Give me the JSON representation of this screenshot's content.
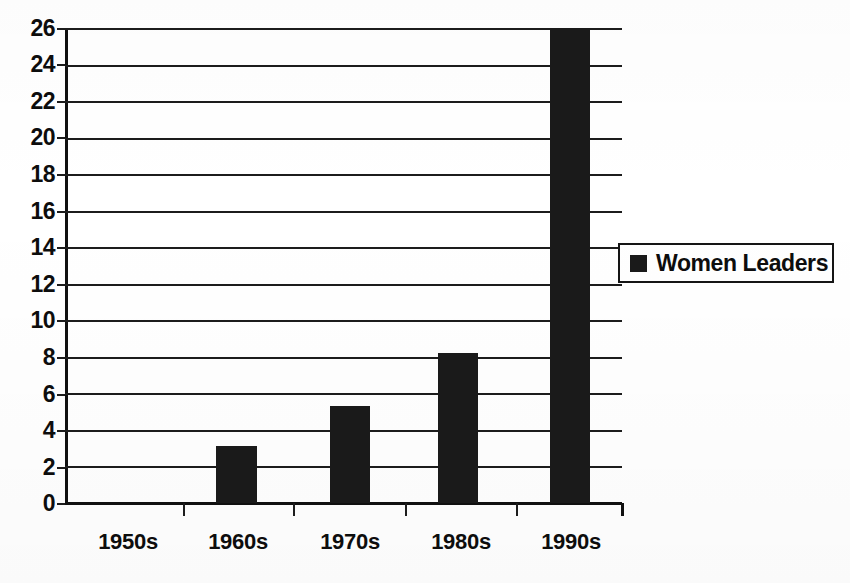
{
  "chart_data": {
    "type": "bar",
    "title": "",
    "subtitle": "",
    "xlabel": "",
    "ylabel": "",
    "categories": [
      "1950s",
      "1960s",
      "1970s",
      "1980s",
      "1990s"
    ],
    "series": [
      {
        "name": "Women Leaders",
        "values": [
          0,
          3.1,
          5.3,
          8.2,
          26
        ]
      }
    ],
    "values": [
      0,
      3.1,
      5.3,
      8.2,
      26
    ],
    "ylim": [
      0,
      26
    ],
    "yticks": [
      0,
      2,
      4,
      6,
      8,
      10,
      12,
      14,
      16,
      18,
      20,
      22,
      24,
      26
    ],
    "ytick_labels": [
      "0",
      "2",
      "4",
      "6",
      "8",
      "10",
      "12",
      "14",
      "16",
      "18",
      "20",
      "22",
      "24",
      "26"
    ],
    "grid": true,
    "grid_axis": "y",
    "legend": {
      "position": "center-right",
      "entries": [
        {
          "label": "Women Leaders",
          "color": "#1a1a1a",
          "marker": "filled-square"
        }
      ]
    },
    "colors": {
      "bar": "#1a1a1a",
      "axis": "#101010",
      "grid": "#1c1c1c",
      "background": "#ffffff",
      "text": "#0d0d0d"
    }
  }
}
